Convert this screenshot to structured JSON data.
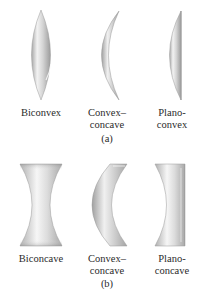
{
  "figure": {
    "panels": [
      {
        "caption": "(a)",
        "lenses": [
          {
            "type": "biconvex",
            "label_line1": "Biconvex",
            "label_line2": ""
          },
          {
            "type": "convex-concave",
            "label_line1": "Convex–",
            "label_line2": "concave"
          },
          {
            "type": "plano-convex",
            "label_line1": "Plano-",
            "label_line2": "convex"
          }
        ]
      },
      {
        "caption": "(b)",
        "lenses": [
          {
            "type": "biconcave",
            "label_line1": "Biconcave",
            "label_line2": ""
          },
          {
            "type": "convex-concave",
            "label_line1": "Convex–",
            "label_line2": "concave"
          },
          {
            "type": "plano-concave",
            "label_line1": "Plano-",
            "label_line2": "concave"
          }
        ]
      }
    ],
    "colors": {
      "background": "#ffffff",
      "lens_light": "#f4f4f4",
      "lens_mid": "#c8c8c8",
      "lens_dark": "#9a9a9a",
      "text": "#2a2a2a"
    }
  }
}
